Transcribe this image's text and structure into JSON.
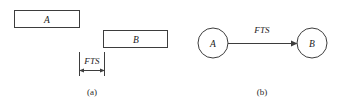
{
  "figure": {
    "background_color": "#ffffff",
    "line_color": "#3d3d3d",
    "text_color": "#1a1a1a"
  },
  "panel_a": {
    "caption": "(a)",
    "notation": "bar-chart",
    "bars": [
      {
        "label": "A",
        "x": 14,
        "y": 10,
        "width": 66,
        "height": 18
      },
      {
        "label": "B",
        "x": 103,
        "y": 30,
        "width": 65,
        "height": 18
      }
    ],
    "dimension": {
      "label": "FTS",
      "from_x": 79,
      "to_x": 104,
      "line_y": 70,
      "ext_top_y": 52,
      "ext_bottom_y": 76
    }
  },
  "panel_b": {
    "caption": "(b)",
    "notation": "network-node",
    "nodes": [
      {
        "label": "A",
        "cx": 213,
        "cy": 43,
        "r": 15
      },
      {
        "label": "B",
        "cx": 312,
        "cy": 43,
        "r": 15
      }
    ],
    "link": {
      "label": "FTS",
      "from_node": "A",
      "to_node": "B",
      "label_x": 262,
      "label_y": 31,
      "start_x": 228,
      "end_x": 297,
      "y": 43
    }
  }
}
